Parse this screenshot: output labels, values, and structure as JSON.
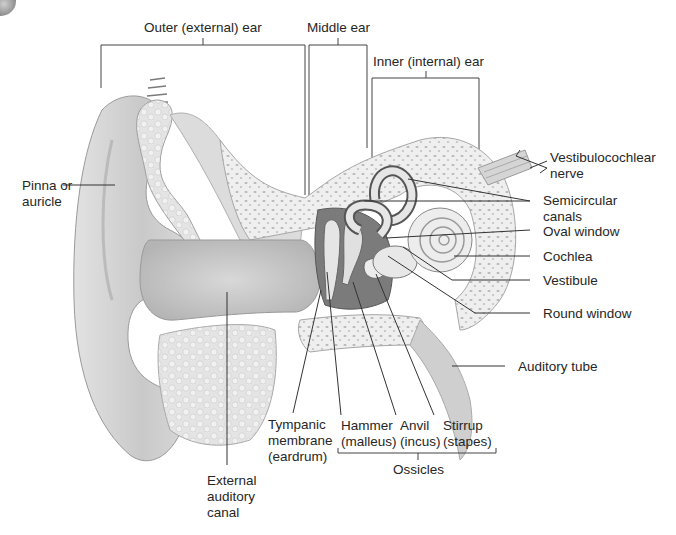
{
  "diagram": {
    "regions": [
      {
        "id": "outer",
        "label": "Outer (external) ear"
      },
      {
        "id": "middle",
        "label": "Middle ear"
      },
      {
        "id": "inner",
        "label": "Inner (internal) ear"
      }
    ],
    "labels": {
      "pinna_l1": "Pinna or",
      "pinna_l2": "auricle",
      "vestib_nerve_l1": "Vestibulocochlear",
      "vestib_nerve_l2": "nerve",
      "semicircular_l1": "Semicircular",
      "semicircular_l2": "canals",
      "oval_window": "Oval window",
      "cochlea": "Cochlea",
      "vestibule": "Vestibule",
      "round_window": "Round window",
      "auditory_tube": "Auditory tube",
      "tympanic_l1": "Tympanic",
      "tympanic_l2": "membrane",
      "tympanic_l3": "(eardrum)",
      "hammer_l1": "Hammer",
      "hammer_l2": "(malleus)",
      "anvil_l1": "Anvil",
      "anvil_l2": "(incus)",
      "stirrup_l1": "Stirrup",
      "stirrup_l2": "(stapes)",
      "ossicles": "Ossicles",
      "ext_canal_l1": "External",
      "ext_canal_l2": "auditory",
      "ext_canal_l3": "canal"
    },
    "colors": {
      "text": "#262626",
      "leader_line": "#333333",
      "tissue_light": "#e6e6e6",
      "tissue_mid": "#bdbdbd",
      "tissue_dark": "#6e6e6e",
      "bone": "#f2f2f2"
    }
  }
}
